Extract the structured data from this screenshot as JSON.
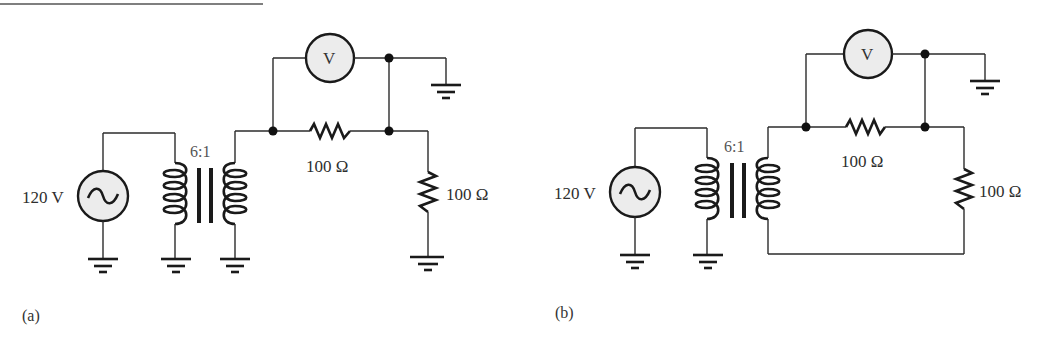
{
  "figure": {
    "top_rule": true,
    "panels": [
      {
        "id": "a",
        "label": "(a)",
        "source": {
          "label": "120 V",
          "type": "ac-voltage-source"
        },
        "transformer": {
          "ratio": "6:1"
        },
        "series_resistor": {
          "label": "100 Ω"
        },
        "load_resistor": {
          "label": "100 Ω"
        },
        "voltmeter": {
          "symbol": "V"
        },
        "secondary_bottom": "grounded",
        "load_bottom": "grounded"
      },
      {
        "id": "b",
        "label": "(b)",
        "source": {
          "label": "120 V",
          "type": "ac-voltage-source"
        },
        "transformer": {
          "ratio": "6:1"
        },
        "series_resistor": {
          "label": "100 Ω"
        },
        "load_resistor": {
          "label": "100 Ω"
        },
        "voltmeter": {
          "symbol": "V"
        },
        "secondary_bottom": "return-wire-to-load (floating secondary)",
        "load_bottom": "return-wire"
      }
    ]
  }
}
